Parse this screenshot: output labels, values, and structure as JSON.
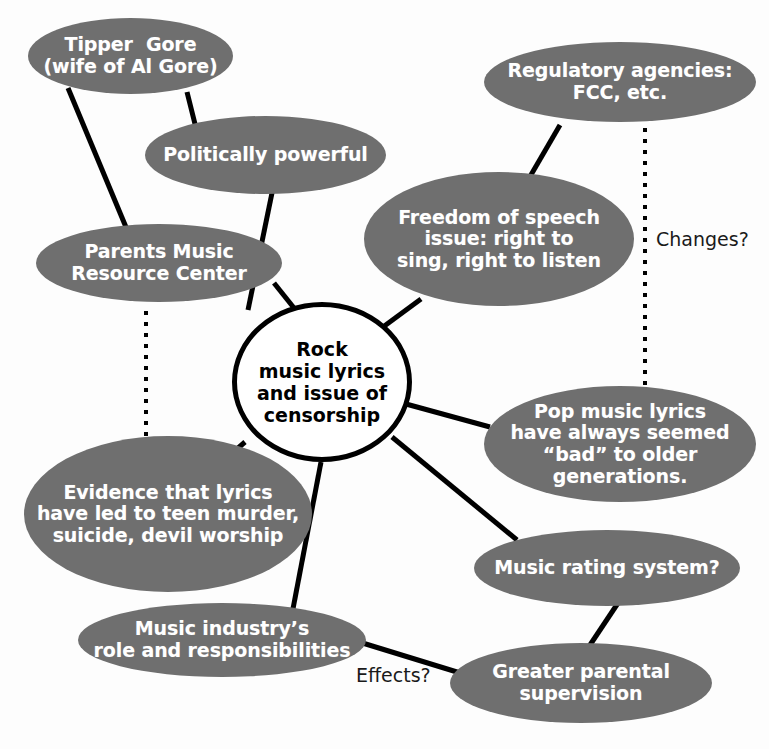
{
  "diagram": {
    "colors": {
      "oval_fill": "#6f6f6f",
      "oval_text": "#ffffff",
      "center_fill": "#ffffff",
      "center_text": "#000000",
      "edge": "#000000",
      "background": "#ffffff"
    }
  },
  "center": {
    "id": "center",
    "label": "Rock music lyrics and issue of censorship",
    "lines": [
      "Rock",
      "music lyrics",
      "and issue of",
      "censorship"
    ],
    "shape": "circle",
    "cx": 322,
    "cy": 382,
    "rx": 90,
    "ry": 80,
    "font_size": 19
  },
  "nodes": [
    {
      "id": "tipper-gore",
      "label": "Tipper  Gore (wife of Al Gore)",
      "lines": [
        "Tipper  Gore",
        "(wife of Al Gore)"
      ],
      "x": 28,
      "y": 18,
      "w": 205,
      "h": 76,
      "font_size": 19
    },
    {
      "id": "politically-powerful",
      "label": "Politically powerful",
      "lines": [
        "Politically powerful"
      ],
      "x": 145,
      "y": 116,
      "w": 241,
      "h": 78,
      "font_size": 19
    },
    {
      "id": "pmrc",
      "label": "Parents Music Resource Center",
      "lines": [
        "Parents Music",
        "Resource Center"
      ],
      "x": 36,
      "y": 224,
      "w": 246,
      "h": 78,
      "font_size": 19
    },
    {
      "id": "regulatory-agencies",
      "label": "Regulatory agencies: FCC, etc.",
      "lines": [
        "Regulatory agencies:",
        "FCC, etc."
      ],
      "x": 484,
      "y": 42,
      "w": 272,
      "h": 80,
      "font_size": 19
    },
    {
      "id": "freedom-of-speech",
      "label": "Freedom of speech issue: right to sing, right to listen",
      "lines": [
        "Freedom of speech",
        "issue: right to",
        "sing, right to listen"
      ],
      "x": 364,
      "y": 172,
      "w": 270,
      "h": 134,
      "font_size": 19
    },
    {
      "id": "pop-music-lyrics",
      "label": "Pop music lyrics have always seemed “bad” to older generations.",
      "lines": [
        "Pop music lyrics",
        "have always seemed",
        "“bad” to older",
        "generations."
      ],
      "x": 484,
      "y": 386,
      "w": 272,
      "h": 116,
      "font_size": 19
    },
    {
      "id": "evidence-lyrics",
      "label": "Evidence that lyrics have led to teen murder, suicide, devil worship",
      "lines": [
        "Evidence that lyrics",
        "have led to teen murder,",
        "suicide, devil worship"
      ],
      "x": 24,
      "y": 436,
      "w": 288,
      "h": 156,
      "font_size": 19
    },
    {
      "id": "music-rating-system",
      "label": "Music rating system?",
      "lines": [
        "Music rating system?"
      ],
      "x": 474,
      "y": 530,
      "w": 266,
      "h": 76,
      "font_size": 19
    },
    {
      "id": "music-industry-role",
      "label": "Music industry’s role and responsibilities",
      "lines": [
        "Music industry’s",
        "role and responsibilities"
      ],
      "x": 78,
      "y": 603,
      "w": 288,
      "h": 74,
      "font_size": 19
    },
    {
      "id": "greater-parental-supervision",
      "label": "Greater parental supervision",
      "lines": [
        "Greater parental",
        "supervision"
      ],
      "x": 450,
      "y": 643,
      "w": 262,
      "h": 80,
      "font_size": 19
    }
  ],
  "edges": [
    {
      "id": "tipper-to-pmrc",
      "from": "tipper-gore",
      "to": "pmrc",
      "style": "solid",
      "x1": 68,
      "y1": 88,
      "x2": 128,
      "y2": 232
    },
    {
      "id": "tipper-to-politically-powerful",
      "from": "tipper-gore",
      "to": "politically-powerful",
      "style": "solid",
      "x1": 187,
      "y1": 92,
      "x2": 196,
      "y2": 128
    },
    {
      "id": "politically-powerful-to-center",
      "from": "politically-powerful",
      "to": "center",
      "style": "solid",
      "x1": 273,
      "y1": 188,
      "x2": 248,
      "y2": 310
    },
    {
      "id": "pmrc-to-center",
      "from": "pmrc",
      "to": "center",
      "style": "solid",
      "x1": 274,
      "y1": 283,
      "x2": 318,
      "y2": 338
    },
    {
      "id": "pmrc-to-evidence",
      "from": "pmrc",
      "to": "evidence-lyrics",
      "style": "dotted",
      "x1": 146,
      "y1": 311,
      "x2": 146,
      "y2": 452
    },
    {
      "id": "regulatory-to-freedom",
      "from": "regulatory-agencies",
      "to": "freedom-of-speech",
      "style": "solid",
      "x1": 560,
      "y1": 125,
      "x2": 528,
      "y2": 180
    },
    {
      "id": "regulatory-to-pop",
      "from": "regulatory-agencies",
      "to": "pop-music-lyrics",
      "style": "dotted",
      "x1": 645,
      "y1": 128,
      "x2": 645,
      "y2": 392
    },
    {
      "id": "freedom-to-center",
      "from": "freedom-of-speech",
      "to": "center",
      "style": "solid",
      "x1": 421,
      "y1": 299,
      "x2": 383,
      "y2": 327
    },
    {
      "id": "center-to-pop",
      "from": "center",
      "to": "pop-music-lyrics",
      "style": "solid",
      "x1": 406,
      "y1": 404,
      "x2": 490,
      "y2": 427
    },
    {
      "id": "center-to-rating",
      "from": "center",
      "to": "music-rating-system",
      "style": "solid",
      "x1": 392,
      "y1": 437,
      "x2": 517,
      "y2": 540
    },
    {
      "id": "center-to-evidence",
      "from": "center",
      "to": "evidence-lyrics",
      "style": "solid",
      "x1": 245,
      "y1": 442,
      "x2": 222,
      "y2": 462
    },
    {
      "id": "center-to-music-industry",
      "from": "center",
      "to": "music-industry-role",
      "style": "solid",
      "x1": 321,
      "y1": 462,
      "x2": 292,
      "y2": 614
    },
    {
      "id": "rating-to-supervision",
      "from": "music-rating-system",
      "to": "greater-parental-supervision",
      "style": "solid",
      "x1": 618,
      "y1": 603,
      "x2": 580,
      "y2": 660
    },
    {
      "id": "music-industry-to-supervision",
      "from": "music-industry-role",
      "to": "greater-parental-supervision",
      "style": "solid",
      "x1": 356,
      "y1": 641,
      "x2": 470,
      "y2": 676
    }
  ],
  "edge_labels": [
    {
      "id": "changes-label",
      "text": "Changes?",
      "x": 656,
      "y": 228,
      "font_size": 19
    },
    {
      "id": "effects-label",
      "text": "Effects?",
      "x": 356,
      "y": 664,
      "font_size": 19
    }
  ]
}
